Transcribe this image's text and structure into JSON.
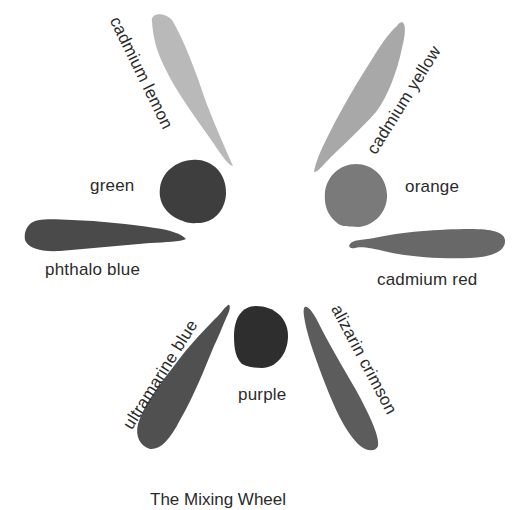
{
  "title": "The Mixing Wheel",
  "colors": {
    "cadmium_lemon": "#b9b9b9",
    "cadmium_yellow": "#a8a8a8",
    "green": "#3e3e3e",
    "orange": "#7a7a7a",
    "phthalo_blue": "#4a4a4a",
    "cadmium_red": "#686868",
    "ultramarine_blue": "#505050",
    "purple": "#2e2e2e",
    "alizarin_crimson": "#5c5c5c",
    "text": "#2b2b2b",
    "background": "#ffffff"
  },
  "swatches": [
    {
      "id": "cadmium-lemon",
      "label": "cadmium lemon",
      "shape": "stroke"
    },
    {
      "id": "cadmium-yellow",
      "label": "cadmium yellow",
      "shape": "stroke"
    },
    {
      "id": "green",
      "label": "green",
      "shape": "dot"
    },
    {
      "id": "orange",
      "label": "orange",
      "shape": "dot"
    },
    {
      "id": "phthalo-blue",
      "label": "phthalo blue",
      "shape": "stroke"
    },
    {
      "id": "cadmium-red",
      "label": "cadmium red",
      "shape": "stroke"
    },
    {
      "id": "ultramarine-blue",
      "label": "ultramarine blue",
      "shape": "stroke"
    },
    {
      "id": "purple",
      "label": "purple",
      "shape": "dot"
    },
    {
      "id": "alizarin-crimson",
      "label": "alizarin crimson",
      "shape": "stroke"
    }
  ]
}
